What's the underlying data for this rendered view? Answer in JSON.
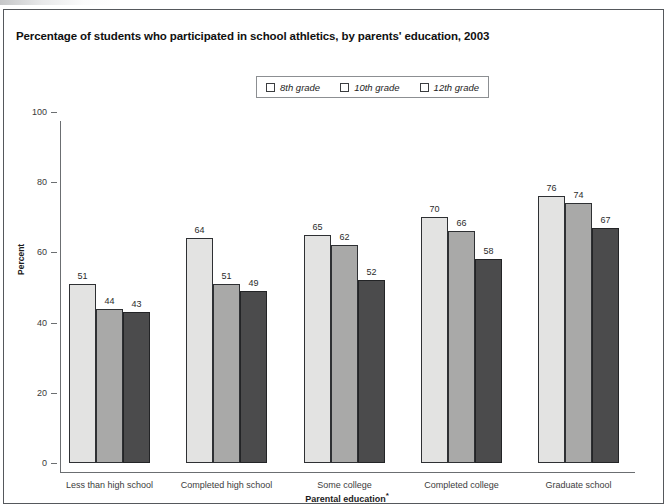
{
  "figure": {
    "title": "Percentage of students who participated in school athletics, by parents' education, 2003"
  },
  "legend": {
    "items": [
      {
        "label": "8th grade",
        "color": "#e3e3e2"
      },
      {
        "label": "10th grade",
        "color": "#a9a9a8"
      },
      {
        "label": "12th grade",
        "color": "#4b4b4c"
      }
    ]
  },
  "axes": {
    "y_title": "Percent",
    "x_title": "Parental education",
    "x_title_note": "*",
    "y_ticks": [
      "0",
      "20",
      "40",
      "60",
      "80",
      "100"
    ]
  },
  "chart_data": {
    "type": "bar",
    "title": "Percentage of students who participated in school athletics, by parents' education, 2003",
    "xlabel": "Parental education*",
    "ylabel": "Percent",
    "ylim": [
      0,
      100
    ],
    "yticks": [
      0,
      20,
      40,
      60,
      80,
      100
    ],
    "grid": false,
    "legend_position": "top-center",
    "categories": [
      "Less than high school",
      "Completed high school",
      "Some college",
      "Completed college",
      "Graduate school"
    ],
    "series": [
      {
        "name": "8th grade",
        "color": "#e3e3e2",
        "values": [
          51,
          64,
          65,
          70,
          76
        ]
      },
      {
        "name": "10th grade",
        "color": "#a9a9a8",
        "values": [
          44,
          51,
          62,
          66,
          74
        ]
      },
      {
        "name": "12th grade",
        "color": "#4b4b4c",
        "values": [
          43,
          49,
          52,
          58,
          67
        ]
      }
    ]
  }
}
